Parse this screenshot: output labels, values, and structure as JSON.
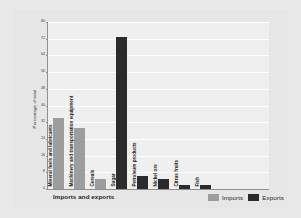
{
  "chart_data": {
    "type": "bar",
    "title": "",
    "xlabel": "Imports and exports",
    "ylabel": "Percentage of total",
    "ylim": [
      0,
      80
    ],
    "ytick_step": 8,
    "yticks": [
      "80",
      "72",
      "64",
      "56",
      "48",
      "40",
      "32",
      "24",
      "16",
      "8",
      "0"
    ],
    "grid": true,
    "legend_position": "bottom-right",
    "categories": [
      "Mineral fuels and lubricants",
      "Machinery and transportation equipment",
      "Cereals",
      "Sugar",
      "Petroleum products",
      "Nickel ore",
      "Citrus fruits",
      "Fish"
    ],
    "series": [
      {
        "name": "Imports",
        "color": "#9d9d9d",
        "values": [
          34,
          29,
          5,
          null,
          null,
          null,
          null,
          null
        ]
      },
      {
        "name": "Exports",
        "color": "#2b2b2b",
        "values": [
          null,
          null,
          null,
          73,
          6,
          5,
          2,
          2
        ]
      }
    ],
    "bars": [
      {
        "category": "Mineral fuels and lubricants",
        "series": "Imports",
        "value": 34
      },
      {
        "category": "Machinery and transportation equipment",
        "series": "Imports",
        "value": 29
      },
      {
        "category": "Cereals",
        "series": "Imports",
        "value": 5
      },
      {
        "category": "Sugar",
        "series": "Exports",
        "value": 73
      },
      {
        "category": "Petroleum products",
        "series": "Exports",
        "value": 6
      },
      {
        "category": "Nickel ore",
        "series": "Exports",
        "value": 5
      },
      {
        "category": "Citrus fruits",
        "series": "Exports",
        "value": 2
      },
      {
        "category": "Fish",
        "series": "Exports",
        "value": 2
      }
    ]
  },
  "legend": {
    "items": [
      {
        "label": "Imports",
        "color": "#9d9d9d"
      },
      {
        "label": "Exports",
        "color": "#2b2b2b"
      }
    ]
  },
  "colors": {
    "imports": "#9d9d9d",
    "exports": "#2b2b2b",
    "background": "#e6e6e6",
    "plot_background": "#efefef",
    "gridline": "#ffffff",
    "axis": "#8f8f8f"
  }
}
